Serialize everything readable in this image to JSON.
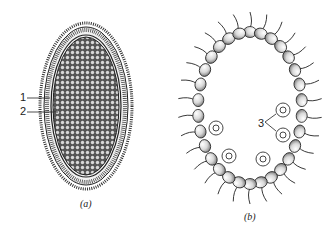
{
  "figure": {
    "panels": [
      {
        "id": "a",
        "caption": "(a)",
        "description": "Oval colony cross-section with outer hatched rim and dense cellular interior",
        "labels": [
          {
            "text": "1",
            "target": "outer-layer"
          },
          {
            "text": "2",
            "target": "inner-layer"
          }
        ]
      },
      {
        "id": "b",
        "caption": "(b)",
        "description": "Hollow ring of flagellated cells with daughter colonies inside",
        "labels": [
          {
            "text": "3",
            "target": "daughter-colonies"
          }
        ]
      }
    ]
  },
  "colors": {
    "ink": "#222222",
    "cell_fill": "#e9e9e9",
    "background": "#ffffff"
  }
}
